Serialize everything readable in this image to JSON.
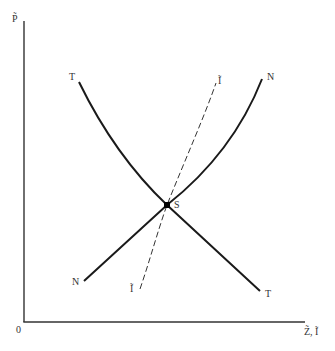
{
  "diagram": {
    "axes": {
      "y_label": "P̃",
      "x_label": "Z̃, Ĩ",
      "origin_label": "0"
    },
    "curves": {
      "TT": {
        "label_top": "T",
        "label_bottom": "T"
      },
      "NN": {
        "label_top": "N",
        "label_bottom": "N"
      },
      "II": {
        "label_top": "Ĩ",
        "label_bottom": "Ĩ",
        "style": "dashed"
      }
    },
    "equilibrium": {
      "label": "S"
    },
    "colors": {
      "line": "#1a1a1a",
      "text": "#333333",
      "background": "#ffffff"
    }
  }
}
